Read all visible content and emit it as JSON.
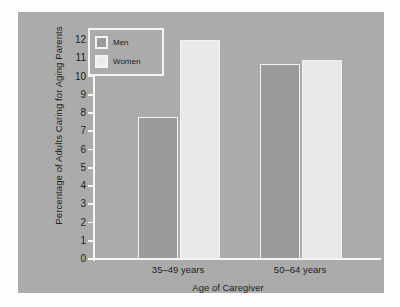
{
  "chart_data": {
    "type": "bar",
    "title": "",
    "xlabel": "Age of Caregiver",
    "ylabel": "Percentage of Adults Caring for Aging Parents",
    "categories": [
      "35–49 years",
      "50–64 years"
    ],
    "series": [
      {
        "name": "Men",
        "values": [
          7.8,
          10.7
        ],
        "color": "#9b9b9b"
      },
      {
        "name": "Women",
        "values": [
          12.0,
          10.9
        ],
        "color": "#e9e9e9"
      }
    ],
    "ylim": [
      0,
      12
    ],
    "yticks": [
      "0",
      "1",
      "2",
      "3",
      "4",
      "5",
      "6",
      "7",
      "8",
      "9",
      "10",
      "11",
      "12"
    ],
    "grid": false,
    "legend_position": "top-left",
    "panel_color": "#ababab",
    "axis_color": "#f7f7f7"
  },
  "legend": {
    "items": [
      {
        "label": "Men"
      },
      {
        "label": "Women"
      }
    ]
  }
}
